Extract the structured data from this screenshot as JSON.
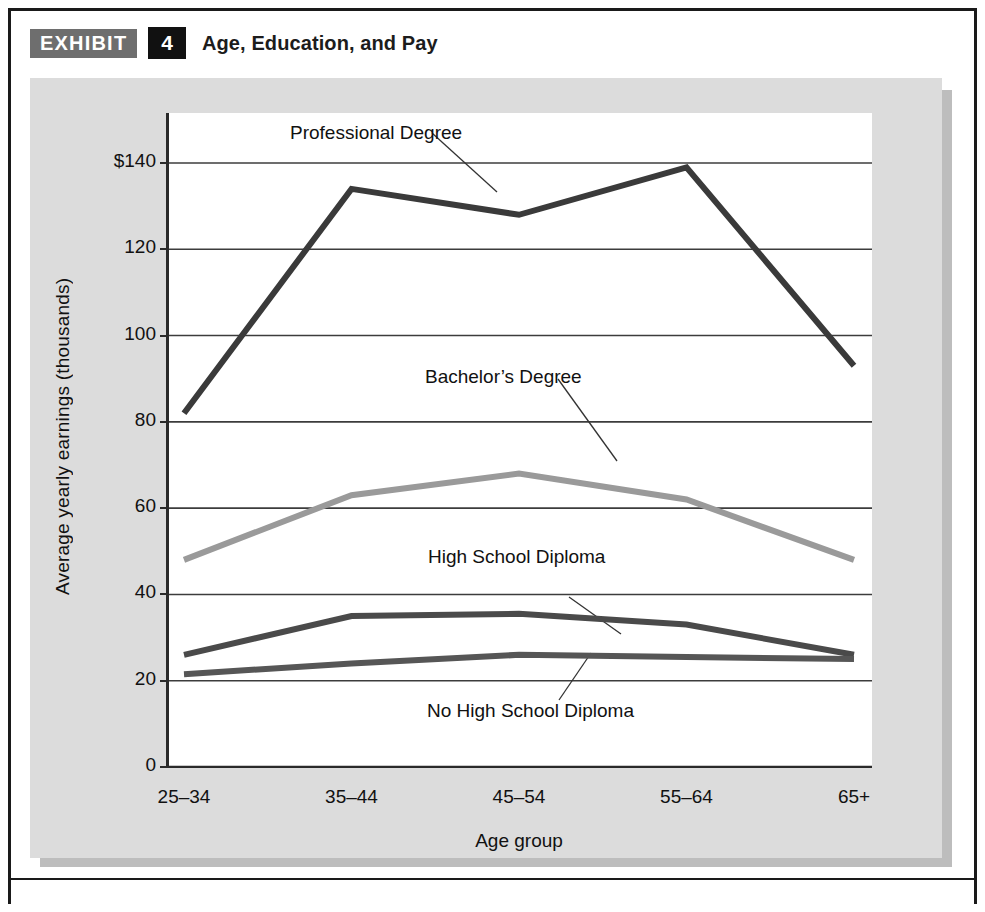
{
  "exhibit": {
    "word": "EXHIBIT",
    "number": "4",
    "title": "Age, Education, and Pay"
  },
  "colors": {
    "exhibit_word_bg": "#6e6e6e",
    "exhibit_number_bg": "#111111",
    "plate_bg": "#dcdcdc",
    "plot_bg": "#ffffff",
    "gridline": "#3c3c3c",
    "professional_degree": "#3a3a3a",
    "bachelors_degree": "#9a9a9a",
    "high_school_diploma": "#4a4a4a",
    "no_high_school_diploma": "#565656"
  },
  "chart_data": {
    "type": "line",
    "title": "Age, Education, and Pay",
    "xlabel": "Age group",
    "ylabel": "Average yearly earnings (thousands)",
    "categories": [
      "25–34",
      "35–44",
      "45–54",
      "55–64",
      "65+"
    ],
    "ylim": [
      0,
      145
    ],
    "yticks": [
      0,
      20,
      40,
      60,
      80,
      100,
      120,
      140
    ],
    "ytick_labels": [
      "0",
      "20",
      "40",
      "60",
      "80",
      "100",
      "120",
      "$140"
    ],
    "grid": "horizontal",
    "legend": "inline-annotations",
    "series": [
      {
        "name": "Professional Degree",
        "color": "#3a3a3a",
        "values": [
          82,
          134,
          128,
          139,
          93
        ]
      },
      {
        "name": "Bachelor's Degree",
        "color": "#9a9a9a",
        "values": [
          48,
          63,
          68,
          62,
          48
        ]
      },
      {
        "name": "High School Diploma",
        "color": "#4a4a4a",
        "values": [
          26,
          35,
          35.5,
          33,
          26
        ]
      },
      {
        "name": "No High School Diploma",
        "color": "#565656",
        "values": [
          21.5,
          24,
          26,
          25.5,
          25
        ]
      }
    ],
    "annotations": [
      {
        "text": "Professional Degree",
        "target_series": "Professional Degree"
      },
      {
        "text": "Bachelor’s Degree",
        "target_series": "Bachelor's Degree"
      },
      {
        "text": "High School Diploma",
        "target_series": "High School Diploma"
      },
      {
        "text": "No High School Diploma",
        "target_series": "No High School Diploma"
      }
    ]
  }
}
